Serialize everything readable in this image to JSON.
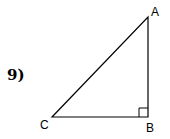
{
  "problem": {
    "number_label": "9)"
  },
  "triangle": {
    "vertices": [
      {
        "name": "A",
        "x": 148,
        "y": 17
      },
      {
        "name": "B",
        "x": 148,
        "y": 117
      },
      {
        "name": "C",
        "x": 52,
        "y": 117
      }
    ],
    "right_angle_at": "B",
    "labels": {
      "A": "A",
      "B": "B",
      "C": "C"
    },
    "stroke_color": "#000000"
  }
}
